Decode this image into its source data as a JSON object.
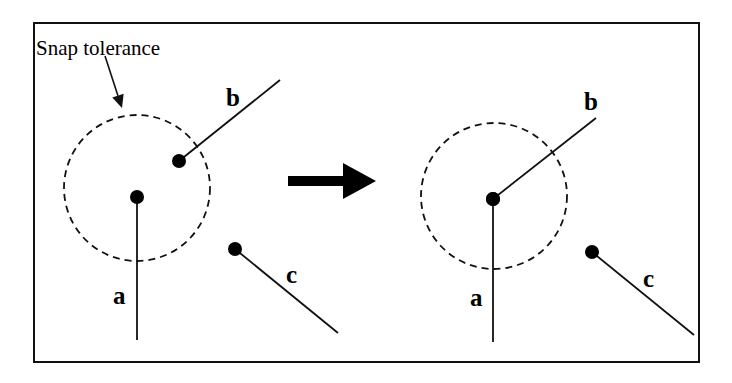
{
  "diagram": {
    "colors": {
      "ink": "#111111",
      "background": "#ffffff"
    },
    "frame": {
      "x": 34,
      "y": 23,
      "w": 665,
      "h": 339
    },
    "caption": {
      "text": "Snap tolerance",
      "x": 36,
      "y": 55
    },
    "caption_arrow": {
      "x1": 105,
      "y1": 56,
      "x2": 122,
      "y2": 108
    },
    "transition_arrow": {
      "shaft_x1": 288,
      "shaft_x2": 343,
      "y": 181,
      "head_tip_x": 376
    },
    "panels": [
      {
        "name": "before",
        "tolerance_circle": {
          "cx": 137,
          "cy": 188,
          "r": 73
        },
        "lines": [
          {
            "id": "a",
            "label": "a",
            "x1": 137,
            "y1": 197,
            "x2": 137,
            "y2": 340,
            "node": {
              "x": 137,
              "y": 197
            },
            "label_pos": {
              "x": 113,
              "y": 304
            }
          },
          {
            "id": "b",
            "label": "b",
            "x1": 179,
            "y1": 161,
            "x2": 280,
            "y2": 80,
            "node": {
              "x": 179,
              "y": 161
            },
            "label_pos": {
              "x": 226,
              "y": 106
            }
          },
          {
            "id": "c",
            "label": "c",
            "x1": 235,
            "y1": 249,
            "x2": 338,
            "y2": 333,
            "node": {
              "x": 235,
              "y": 249
            },
            "label_pos": {
              "x": 286,
              "y": 283
            }
          }
        ]
      },
      {
        "name": "after",
        "tolerance_circle": {
          "cx": 494,
          "cy": 196,
          "r": 73
        },
        "lines": [
          {
            "id": "a",
            "label": "a",
            "x1": 493,
            "y1": 199,
            "x2": 493,
            "y2": 342,
            "node": {
              "x": 493,
              "y": 199
            },
            "label_pos": {
              "x": 470,
              "y": 306
            }
          },
          {
            "id": "b",
            "label": "b",
            "x1": 493,
            "y1": 199,
            "x2": 596,
            "y2": 118,
            "node": null,
            "label_pos": {
              "x": 584,
              "y": 110
            }
          },
          {
            "id": "c",
            "label": "c",
            "x1": 592,
            "y1": 252,
            "x2": 694,
            "y2": 335,
            "node": {
              "x": 592,
              "y": 252
            },
            "label_pos": {
              "x": 643,
              "y": 287
            }
          }
        ]
      }
    ]
  }
}
